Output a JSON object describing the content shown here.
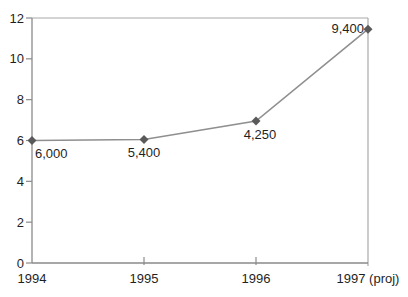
{
  "chart_data": {
    "type": "line",
    "title": "",
    "xlabel": "",
    "ylabel": "",
    "categories": [
      "1994",
      "1995",
      "1996",
      "1997 (proj)"
    ],
    "series": [
      {
        "name": "annual-series",
        "values": [
          6.0,
          6.05,
          6.95,
          11.45
        ],
        "point_labels": [
          "6,000",
          "5,400",
          "4,250",
          "9,400"
        ]
      }
    ],
    "ylim": [
      0,
      12
    ],
    "y_ticks": [
      "0",
      "2",
      "4",
      "6",
      "8",
      "10",
      "12"
    ],
    "x_inner_ticks": [
      "1995",
      "1996"
    ],
    "grid": "off",
    "legend": "none",
    "plot_box": true,
    "marker_shape": "diamond",
    "label_layout": [
      {
        "dx": 3,
        "dy": 17.5,
        "anchor": "start"
      },
      {
        "dx": 0,
        "dy": 18,
        "anchor": "middle"
      },
      {
        "dx": 4,
        "dy": 17.5,
        "anchor": "middle"
      },
      {
        "dx": -4,
        "dy": 4,
        "anchor": "end"
      }
    ],
    "colors": {
      "line": "#8f8f8f",
      "marker": "#5a5a5a",
      "axis": "#8a8a8a",
      "box_border": "#a9a9a9",
      "text": "#1f1f1f",
      "background": "#ffffff"
    }
  }
}
